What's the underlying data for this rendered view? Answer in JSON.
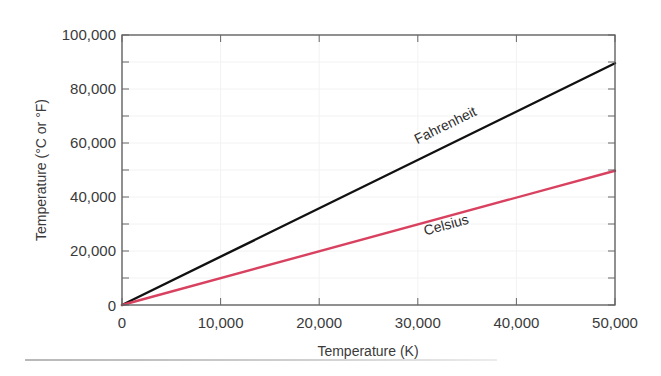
{
  "chart_data": {
    "type": "line",
    "title": "",
    "xlabel": "Temperature (K)",
    "ylabel": "Temperature (°C or °F)",
    "xlim": [
      0,
      50000
    ],
    "ylim": [
      0,
      100000
    ],
    "x_ticks": [
      0,
      10000,
      20000,
      30000,
      40000,
      50000
    ],
    "x_tick_labels": [
      "0",
      "10,000",
      "20,000",
      "30,000",
      "40,000",
      "50,000"
    ],
    "y_ticks": [
      0,
      20000,
      40000,
      60000,
      80000,
      100000
    ],
    "y_tick_labels": [
      "0",
      "20,000",
      "40,000",
      "60,000",
      "80,000",
      "100,000"
    ],
    "grid": true,
    "legend": "inline labels on lines",
    "series": [
      {
        "name": "Fahrenheit",
        "color": "#111111",
        "x": [
          0,
          50000
        ],
        "y": [
          0,
          89540
        ]
      },
      {
        "name": "Celsius",
        "color": "#d8415f",
        "x": [
          0,
          50000
        ],
        "y": [
          0,
          49727
        ]
      }
    ],
    "annotations": [
      {
        "text": "Fahrenheit",
        "x": 33000,
        "y": 65000
      },
      {
        "text": "Celsius",
        "x": 33000,
        "y": 28000
      }
    ]
  }
}
